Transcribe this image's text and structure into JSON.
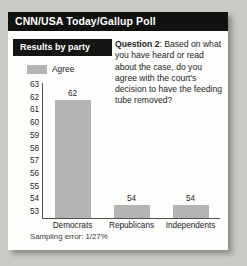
{
  "header": {
    "title": "CNN/USA Today/Gallup Poll"
  },
  "panel": {
    "results_label": "Results by party",
    "question_prefix": "Question 2",
    "question_separator": ": ",
    "question_body": "Based on what you have heard or read about the case, do you agree with the court's decision to have the feeding tube removed?"
  },
  "footer": {
    "sampling_error": "Sampling error: 1/27%"
  },
  "colors": {
    "title_bar": "#111110",
    "results_box": "#151513",
    "bar_fill": "#b4b4b2",
    "axis": "#55524e",
    "card_bg": "#fdfdfb",
    "page_bg": "#c9c9c6"
  },
  "chart_data": {
    "type": "bar",
    "title": "Results by party",
    "categories": [
      "Democrats",
      "Republicans",
      "Independents"
    ],
    "values": [
      62,
      54,
      54
    ],
    "series": [
      {
        "name": "Agree",
        "values": [
          62,
          54,
          54
        ]
      }
    ],
    "legend": [
      "Agree"
    ],
    "legend_position": "top-left",
    "xlabel": "",
    "ylabel": "",
    "ylim": [
      53,
      63
    ],
    "yticks": [
      63,
      62,
      61,
      60,
      59,
      58,
      57,
      56,
      55,
      54,
      53
    ],
    "ytick_labels": [
      "63",
      "62",
      "61",
      "60",
      "59",
      "58",
      "57",
      "56",
      "55",
      "54",
      "53"
    ],
    "data_labels": [
      "62",
      "54",
      "54"
    ],
    "grid": false,
    "annotations": [
      "Sampling error: 1/27%"
    ]
  }
}
